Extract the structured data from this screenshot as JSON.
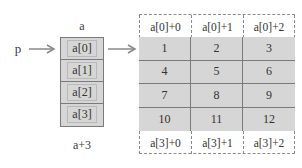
{
  "diagram": {
    "pointer_label": "p",
    "array_label": "a",
    "array_end_label": "a+3",
    "array_elements": [
      "a[0]",
      "a[1]",
      "a[2]",
      "a[3]"
    ],
    "column_headers_top": [
      "a[0]+0",
      "a[0]+1",
      "a[0]+2"
    ],
    "column_headers_bottom": [
      "a[3]+0",
      "a[3]+1",
      "a[3]+2"
    ],
    "matrix": [
      [
        "1",
        "2",
        "3"
      ],
      [
        "4",
        "5",
        "6"
      ],
      [
        "7",
        "8",
        "9"
      ],
      [
        "10",
        "11",
        "12"
      ]
    ],
    "colors": {
      "cell_fill": "#d6d6d6",
      "border": "#7a7a7a",
      "arrow": "#888888",
      "dashed": "#8a8a8a"
    }
  }
}
